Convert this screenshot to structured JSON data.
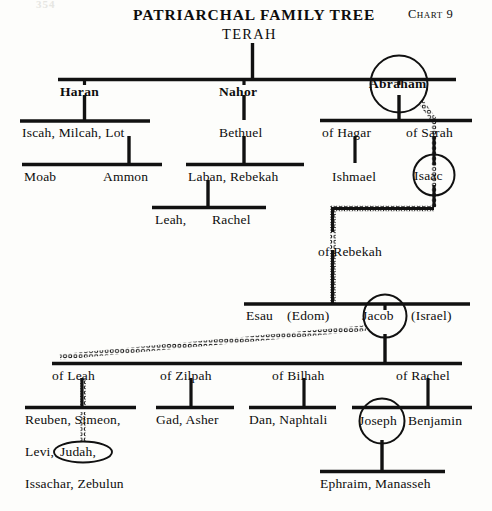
{
  "page": {
    "folio": "354",
    "title": "PATRIARCHAL FAMILY TREE",
    "chart_label": "Chart",
    "chart_number": "9",
    "ink_color": "#0d0d0d",
    "paper_color": "#fdfdfb"
  },
  "root": {
    "label": "TERAH"
  },
  "generations": {
    "sons_of_terah": [
      {
        "id": "haran",
        "label": "Haran",
        "circled": false
      },
      {
        "id": "nahor",
        "label": "Nahor",
        "circled": false
      },
      {
        "id": "abraham",
        "label": "Abraham",
        "circled": true
      }
    ],
    "haran_line": {
      "children": "Iscah, Milcah, Lot",
      "grandchildren": [
        "Moab",
        "Ammon"
      ]
    },
    "nahor_line": {
      "son": "Bethuel",
      "children": "Laban, Rebekah",
      "grandchildren": [
        "Leah,",
        "Rachel"
      ]
    },
    "abraham_line": {
      "wives": [
        "of Hagar",
        "of Sarah"
      ],
      "son_of_hagar": "Ishmael",
      "son_of_sarah": {
        "label": "Isaac",
        "circled": true
      }
    },
    "isaac_line": {
      "wife": "of Rebekah",
      "sons": [
        {
          "id": "esau",
          "label": "Esau",
          "epithet": "(Edom)",
          "circled": false
        },
        {
          "id": "jacob",
          "label": "Jacob",
          "epithet": "(Israel)",
          "circled": true
        }
      ]
    },
    "jacob_line": {
      "wives": [
        "of Leah",
        "of Zilpah",
        "of Bilhah",
        "of Rachel"
      ],
      "children_of_leah": [
        "Reuben, Simeon,",
        "Levi,",
        "Judah,",
        "Issachar, Zebulun"
      ],
      "highlighted_son": "Judah,",
      "children_of_zilpah": "Gad, Asher",
      "children_of_bilhah": "Dan, Naphtali",
      "children_of_rachel": [
        {
          "label": "Joseph",
          "circled": true
        },
        {
          "label": "Benjamin",
          "circled": false
        }
      ],
      "sons_of_joseph": "Ephraim,  Manasseh"
    }
  },
  "legend": {
    "messianic_line_style": "beaded-dotted-line",
    "circled_meaning": "covenant-line-figure"
  }
}
